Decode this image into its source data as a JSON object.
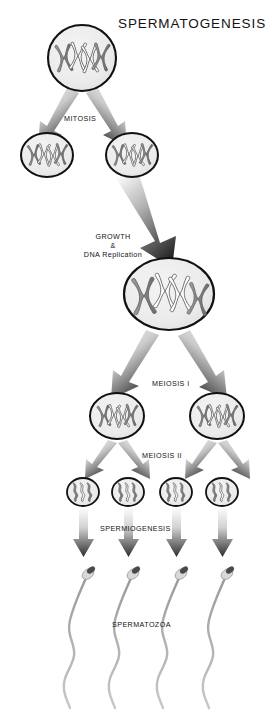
{
  "figure": {
    "title": "SPERMATOGENESIS",
    "background_color": "#ffffff",
    "text_color": "#121212"
  },
  "labels": {
    "title": "SPERMATOGENESIS",
    "mitosis": "MITOSIS",
    "growth": "GROWTH",
    "ampersand": "&",
    "dna_replication": "DNA Replication",
    "meiosis_1": "MEIOSIS I",
    "meiosis_2": "MEIOSIS II",
    "spermiogenesis": "SPERMIOGENESIS",
    "spermatozoa": "SPERMATOZOA"
  },
  "palette": {
    "cell_outline": "#111111",
    "cell_fill": "#ececec",
    "chromosome_gray": "#8f8f8f",
    "chromosome_gray_dark": "#6f6f6f",
    "chromosome_white": "#ffffff",
    "chromosome_outline": "#4a4a4a",
    "arrow_tip": "#2b2b2b",
    "arrow_tail": "#f2f2f2",
    "sperm_tail": "#b9b9b9",
    "sperm_head": "#555555"
  },
  "stages": [
    {
      "id": "spermatogonium",
      "name": "spermatogonium",
      "row": 1,
      "count": 1,
      "cells": [
        {
          "cx": 82,
          "cy": 58,
          "rx": 34,
          "ry": 33
        }
      ],
      "chromosome_style": "duplicated-x",
      "chromosome_count": 4,
      "gray_chromosomes": 2,
      "white_chromosomes": 2
    },
    {
      "id": "spermatogonia-daughters",
      "name": "daughter-spermatogonia",
      "row": 2,
      "count": 2,
      "cells": [
        {
          "cx": 47,
          "cy": 155,
          "rx": 26,
          "ry": 22
        },
        {
          "cx": 132,
          "cy": 155,
          "rx": 26,
          "ry": 22
        }
      ],
      "chromosome_style": "duplicated-x",
      "chromosome_count": 4,
      "gray_chromosomes": 2,
      "white_chromosomes": 2
    },
    {
      "id": "primary-spermatocyte",
      "name": "primary-spermatocyte",
      "row": 3,
      "count": 1,
      "cells": [
        {
          "cx": 169,
          "cy": 294,
          "rx": 45,
          "ry": 36
        }
      ],
      "chromosome_style": "replicated-thick-x",
      "chromosome_count": 4,
      "gray_chromosomes": 2,
      "white_chromosomes": 2
    },
    {
      "id": "secondary-spermatocytes",
      "name": "secondary-spermatocyte",
      "row": 4,
      "count": 2,
      "cells": [
        {
          "cx": 117,
          "cy": 416,
          "rx": 27,
          "ry": 23
        },
        {
          "cx": 217,
          "cy": 416,
          "rx": 27,
          "ry": 23
        }
      ],
      "chromosome_style": "duplicated-x",
      "chromosome_count": 4,
      "gray_chromosomes": 2,
      "white_chromosomes": 2
    },
    {
      "id": "spermatids",
      "name": "spermatid",
      "row": 5,
      "count": 4,
      "cells": [
        {
          "cx": 83,
          "cy": 492,
          "rx": 16,
          "ry": 14
        },
        {
          "cx": 128,
          "cy": 492,
          "rx": 16,
          "ry": 14
        },
        {
          "cx": 176,
          "cy": 492,
          "rx": 16,
          "ry": 14
        },
        {
          "cx": 222,
          "cy": 492,
          "rx": 16,
          "ry": 14
        }
      ],
      "chromosome_style": "single-wavy-chromatid",
      "chromosome_count": 3,
      "gray_chromosomes": 2,
      "white_chromosomes": 1
    },
    {
      "id": "spermatozoa",
      "name": "spermatozoon",
      "row": 6,
      "count": 4,
      "cells": [
        {
          "cx": 86,
          "cy": 578
        },
        {
          "cx": 131,
          "cy": 578
        },
        {
          "cx": 179,
          "cy": 578
        },
        {
          "cx": 225,
          "cy": 578
        }
      ],
      "chromosome_style": "none",
      "chromosome_count": 0
    }
  ],
  "transitions": [
    {
      "id": "mitosis",
      "label": "MITOSIS",
      "from": "spermatogonium",
      "to": "spermatogonia-daughters",
      "arrow_count": 2,
      "arrow_size": "medium"
    },
    {
      "id": "growth",
      "label": "GROWTH & DNA Replication",
      "from": "spermatogonia-daughters",
      "to": "primary-spermatocyte",
      "arrow_count": 1,
      "arrow_size": "large"
    },
    {
      "id": "meiosis-i",
      "label": "MEIOSIS I",
      "from": "primary-spermatocyte",
      "to": "secondary-spermatocytes",
      "arrow_count": 2,
      "arrow_size": "medium"
    },
    {
      "id": "meiosis-ii",
      "label": "MEIOSIS II",
      "from": "secondary-spermatocytes",
      "to": "spermatids",
      "arrow_count": 4,
      "arrow_size": "small"
    },
    {
      "id": "spermiogenesis",
      "label": "SPERMIOGENESIS",
      "from": "spermatids",
      "to": "spermatozoa",
      "arrow_count": 4,
      "arrow_size": "small-straight"
    }
  ]
}
